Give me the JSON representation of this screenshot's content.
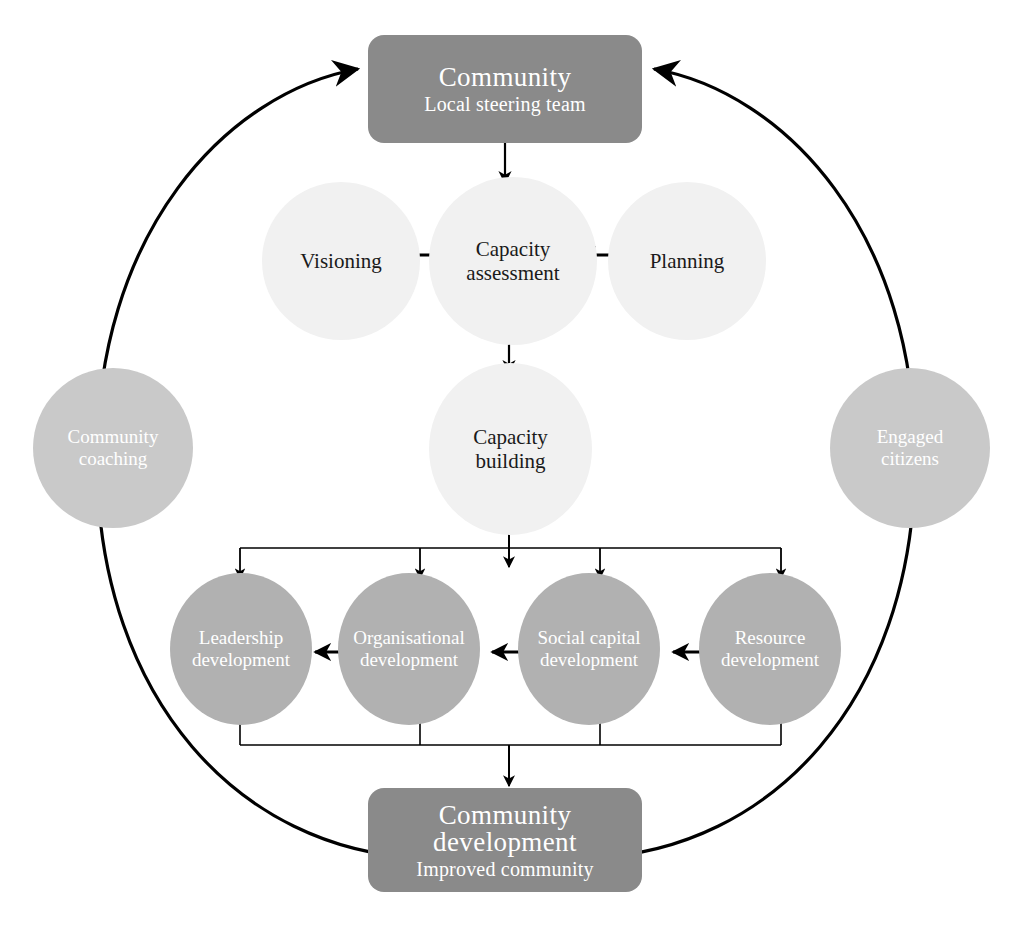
{
  "diagram": {
    "colors": {
      "box_fill": "#8a8a8a",
      "stage_circle_fill": "#f1f1f1",
      "outcome_circle_fill": "#b1b1b1",
      "driver_circle_fill": "#c9c9c9",
      "line": "#000000",
      "box_text": "#ffffff",
      "stage_text": "#1a1a1a",
      "background": "#ffffff"
    },
    "boxes": [
      {
        "id": "community",
        "title": "Community",
        "subtitle": "Local steering team"
      },
      {
        "id": "community-development",
        "title_line1": "Community",
        "title_line2": "development",
        "subtitle": "Improved community"
      }
    ],
    "stage_circles": [
      {
        "id": "visioning",
        "line1": "Visioning",
        "line2": ""
      },
      {
        "id": "capacity-assessment",
        "line1": "Capacity",
        "line2": "assessment"
      },
      {
        "id": "planning",
        "line1": "Planning",
        "line2": ""
      },
      {
        "id": "capacity-building",
        "line1": "Capacity",
        "line2": "building"
      }
    ],
    "outcome_circles": [
      {
        "id": "leadership",
        "line1": "Leadership",
        "line2": "development"
      },
      {
        "id": "organisational",
        "line1": "Organisational",
        "line2": "development"
      },
      {
        "id": "social-capital",
        "line1": "Social capital",
        "line2": "development"
      },
      {
        "id": "resource",
        "line1": "Resource",
        "line2": "development"
      }
    ],
    "driver_circles": [
      {
        "id": "community-coaching",
        "line1": "Community",
        "line2": "coaching"
      },
      {
        "id": "engaged-citizens",
        "line1": "Engaged",
        "line2": "citizens"
      }
    ],
    "connectors": [
      {
        "id": "community-to-capacity-assessment",
        "kind": "arrow-down"
      },
      {
        "id": "visioning-capacity-assessment",
        "kind": "double-arrow-horizontal"
      },
      {
        "id": "capacity-assessment-planning",
        "kind": "double-arrow-horizontal"
      },
      {
        "id": "capacity-assessment-to-capacity-building",
        "kind": "arrow-down"
      },
      {
        "id": "capacity-building-to-outcomes",
        "kind": "fan-out-bracket"
      },
      {
        "id": "leadership-organisational",
        "kind": "double-arrow-horizontal"
      },
      {
        "id": "organisational-social-capital",
        "kind": "double-arrow-horizontal"
      },
      {
        "id": "social-capital-resource",
        "kind": "double-arrow-horizontal"
      },
      {
        "id": "outcomes-to-community-development",
        "kind": "fan-in-bracket"
      },
      {
        "id": "feedback-loop-left",
        "kind": "curved-arrow"
      },
      {
        "id": "feedback-loop-right",
        "kind": "curved-arrow"
      }
    ]
  }
}
